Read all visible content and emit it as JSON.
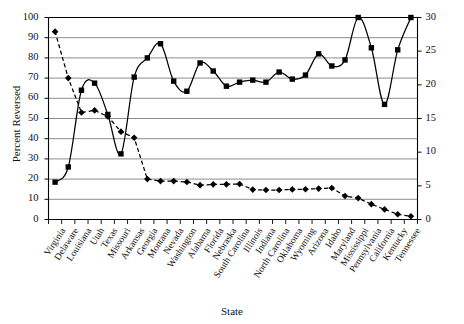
{
  "chart_data": {
    "type": "line",
    "title": "",
    "xlabel": "State",
    "ylabel": "Percent Reversed",
    "ylabel_right": "Percent Death Sentences Carried Out",
    "ylim": [
      0,
      100
    ],
    "ylim_right": [
      0,
      30
    ],
    "yticks": [
      0,
      10,
      20,
      30,
      40,
      50,
      60,
      70,
      80,
      90,
      100
    ],
    "yticks_right": [
      0,
      5,
      10,
      15,
      20,
      25,
      30
    ],
    "grid": true,
    "legend_position": "none",
    "categories": [
      "Virginia",
      "Delaware",
      "Louisiana",
      "Utah",
      "Texas",
      "Missouri",
      "Arkansas",
      "Georgia",
      "Montana",
      "Nevada",
      "Washington",
      "Alabama",
      "Florida",
      "Nebraska",
      "South Carolina",
      "Illinois",
      "Indiana",
      "North Carolina",
      "Oklahoma",
      "Wyoming",
      "Arizona",
      "Idaho",
      "Maryland",
      "Mississippi",
      "Pennsylvania",
      "California",
      "Kentucky",
      "Tennessee"
    ],
    "series": [
      {
        "name": "Percent Death Sentences Carried Out",
        "axis": "right",
        "marker": "diamond",
        "line_style": "dashed",
        "color": "#000000",
        "values": [
          28.0,
          21.0,
          15.9,
          16.2,
          15.3,
          13.1,
          12.2,
          6.0,
          5.7,
          5.7,
          5.6,
          5.1,
          5.2,
          5.2,
          5.3,
          4.4,
          4.4,
          4.4,
          4.5,
          4.5,
          4.6,
          4.7,
          3.5,
          3.2,
          2.3,
          1.5,
          0.8,
          0.5
        ],
        "values_left_scale": [
          93.0,
          70.0,
          53.0,
          54.0,
          51.0,
          43.5,
          40.5,
          20.0,
          19.0,
          19.0,
          18.6,
          17.0,
          17.4,
          17.4,
          17.6,
          14.8,
          14.6,
          14.6,
          14.9,
          15.0,
          15.3,
          15.6,
          11.6,
          10.6,
          7.6,
          5.0,
          2.6,
          1.6
        ]
      },
      {
        "name": "Percent Reversed",
        "axis": "left",
        "marker": "square",
        "line_style": "solid",
        "color": "#000000",
        "values": [
          18.5,
          26.0,
          64.0,
          67.5,
          52.0,
          32.5,
          70.5,
          80.0,
          87.0,
          68.5,
          63.5,
          77.5,
          73.5,
          66.0,
          68.0,
          69.0,
          68.0,
          73.0,
          69.5,
          71.5,
          82.0,
          76.0,
          79.0,
          100.0,
          85.0,
          57.0,
          84.0,
          100.0
        ]
      }
    ]
  }
}
